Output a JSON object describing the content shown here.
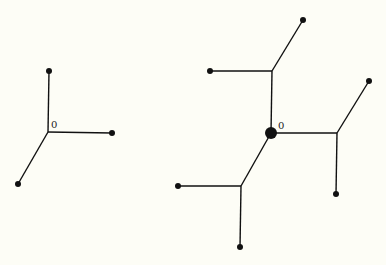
{
  "diagram": {
    "background": "#fdfdf6",
    "stroke_color": "#111111",
    "trees": [
      {
        "id": "left-tree",
        "origin_label": "0",
        "nodes": [
          {
            "id": "o",
            "x": 48,
            "y": 132,
            "r": 0,
            "label": "0"
          },
          {
            "id": "a",
            "x": 49,
            "y": 71,
            "r": 3
          },
          {
            "id": "b",
            "x": 112,
            "y": 133,
            "r": 3
          },
          {
            "id": "c",
            "x": 18,
            "y": 184,
            "r": 3
          }
        ],
        "edges": [
          [
            "o",
            "a"
          ],
          [
            "o",
            "b"
          ],
          [
            "o",
            "c"
          ]
        ]
      },
      {
        "id": "right-tree",
        "origin_label": "0",
        "nodes": [
          {
            "id": "o",
            "x": 271,
            "y": 133,
            "r": 6,
            "label": "0"
          },
          {
            "id": "u",
            "x": 272,
            "y": 71,
            "r": 0
          },
          {
            "id": "u1",
            "x": 303,
            "y": 20,
            "r": 3
          },
          {
            "id": "u2",
            "x": 210,
            "y": 71,
            "r": 3
          },
          {
            "id": "r",
            "x": 337,
            "y": 133,
            "r": 0
          },
          {
            "id": "r1",
            "x": 369,
            "y": 81,
            "r": 3
          },
          {
            "id": "r2",
            "x": 336,
            "y": 194,
            "r": 3
          },
          {
            "id": "l",
            "x": 241,
            "y": 186,
            "r": 0
          },
          {
            "id": "l1",
            "x": 178,
            "y": 186,
            "r": 3
          },
          {
            "id": "l2",
            "x": 240,
            "y": 247,
            "r": 3
          }
        ],
        "edges": [
          [
            "o",
            "u"
          ],
          [
            "u",
            "u1"
          ],
          [
            "u",
            "u2"
          ],
          [
            "o",
            "r"
          ],
          [
            "r",
            "r1"
          ],
          [
            "r",
            "r2"
          ],
          [
            "o",
            "l"
          ],
          [
            "l",
            "l1"
          ],
          [
            "l",
            "l2"
          ]
        ]
      }
    ]
  }
}
